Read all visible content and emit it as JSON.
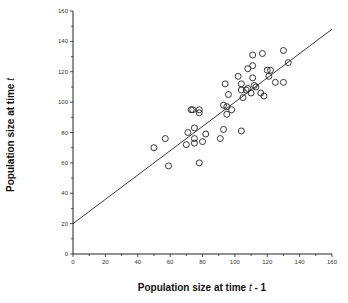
{
  "chart_data": {
    "type": "scatter",
    "title": "",
    "xlabel": "Population size at time t - 1",
    "ylabel": "Population size at time t",
    "xlim": [
      0,
      160
    ],
    "ylim": [
      0,
      160
    ],
    "x_ticks": [
      0,
      20,
      40,
      60,
      80,
      100,
      120,
      140,
      160
    ],
    "y_ticks": [
      0,
      20,
      40,
      60,
      80,
      100,
      120,
      140,
      160
    ],
    "grid": false,
    "legend": null,
    "marker": "open-circle",
    "series": [
      {
        "name": "observations",
        "points": [
          [
            50,
            70
          ],
          [
            57,
            76
          ],
          [
            59,
            58
          ],
          [
            70,
            72
          ],
          [
            71,
            80
          ],
          [
            73,
            95
          ],
          [
            74,
            95
          ],
          [
            75,
            83
          ],
          [
            75,
            76
          ],
          [
            75,
            73
          ],
          [
            78,
            60
          ],
          [
            78,
            95
          ],
          [
            78,
            93
          ],
          [
            80,
            74
          ],
          [
            82,
            79
          ],
          [
            91,
            76
          ],
          [
            93,
            82
          ],
          [
            93,
            98
          ],
          [
            95,
            97
          ],
          [
            95,
            92
          ],
          [
            96,
            105
          ],
          [
            98,
            95
          ],
          [
            94,
            112
          ],
          [
            102,
            117
          ],
          [
            104,
            112
          ],
          [
            104,
            81
          ],
          [
            104,
            108
          ],
          [
            105,
            103
          ],
          [
            107,
            108
          ],
          [
            108,
            122
          ],
          [
            108,
            109
          ],
          [
            110,
            106
          ],
          [
            111,
            124
          ],
          [
            111,
            131
          ],
          [
            111,
            116
          ],
          [
            112,
            111
          ],
          [
            113,
            110
          ],
          [
            116,
            106
          ],
          [
            117,
            132
          ],
          [
            118,
            104
          ],
          [
            120,
            121
          ],
          [
            122,
            121
          ],
          [
            121,
            117
          ],
          [
            125,
            113
          ],
          [
            130,
            113
          ],
          [
            130,
            134
          ],
          [
            133,
            126
          ]
        ]
      }
    ],
    "regression_line": {
      "intercept": 20,
      "slope": 0.8,
      "x_range": [
        0,
        160
      ]
    }
  },
  "labels": {
    "xlabel_main": "Population  size  at  time",
    "xlabel_italic": "t",
    "xlabel_suffix": "- 1",
    "ylabel_main": "Population  size  at  time",
    "ylabel_italic": "t"
  }
}
